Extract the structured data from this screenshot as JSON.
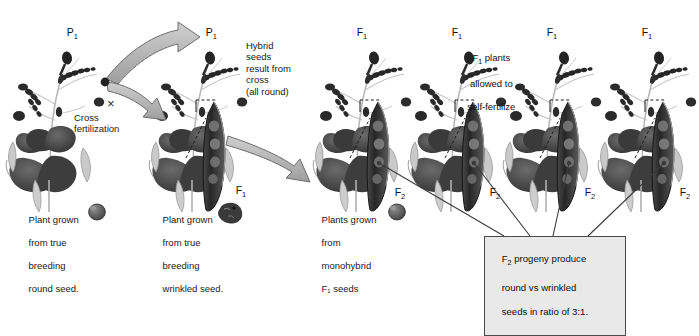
{
  "figure": {
    "type": "genetics-cross-diagram",
    "background": "#ffffff",
    "ink": "#1a1a1a",
    "callout_fill": "#e9e9e9",
    "arrow_fill": "#b6b6b6",
    "arrow_stroke": "#6e6e6e"
  },
  "generation_labels": [
    {
      "id": "p1-left",
      "text": "P",
      "sub": "1",
      "x": 55,
      "y": 14
    },
    {
      "id": "p1-right",
      "text": "P",
      "sub": "1",
      "x": 194,
      "y": 14
    },
    {
      "id": "f1-plant-1",
      "text": "F",
      "sub": "1",
      "x": 345,
      "y": 14
    },
    {
      "id": "f1-plant-2",
      "text": "F",
      "sub": "1",
      "x": 440,
      "y": 14
    },
    {
      "id": "f1-plant-3",
      "text": "F",
      "sub": "1",
      "x": 535,
      "y": 14
    },
    {
      "id": "f1-plant-4",
      "text": "F",
      "sub": "1",
      "x": 630,
      "y": 14
    },
    {
      "id": "f1-pod",
      "text": "F",
      "sub": "1",
      "x": 224,
      "y": 172
    },
    {
      "id": "f2-pod-1",
      "text": "F",
      "sub": "2",
      "x": 383,
      "y": 174
    },
    {
      "id": "f2-pod-2",
      "text": "F",
      "sub": "2",
      "x": 478,
      "y": 174
    },
    {
      "id": "f2-pod-3",
      "text": "F",
      "sub": "2",
      "x": 573,
      "y": 174
    },
    {
      "id": "f2-pod-4",
      "text": "F",
      "sub": "2",
      "x": 668,
      "y": 174
    }
  ],
  "annotations": {
    "cross_symbol": "×",
    "cross_fertilization": "Cross\nfertilization",
    "hybrid_seeds": "Hybrid\nseeds\nresult from\ncross\n(all round)",
    "self_fertilize_line1": "F",
    "self_fertilize_sub": "1",
    "self_fertilize_rest": " plants",
    "self_fertilize_line2": "allowed to",
    "self_fertilize_line3": "self-fertilize"
  },
  "captions": [
    {
      "id": "caption-round-parent",
      "lines": [
        "Plant grown",
        "from true",
        "breeding",
        "round seed."
      ],
      "x": 18,
      "y": 203,
      "seed": {
        "kind": "round-seed-icon",
        "x": 92,
        "y": 203
      }
    },
    {
      "id": "caption-wrinkled-parent",
      "lines": [
        "Plant grown",
        "from true",
        "breeding",
        "wrinkled seed."
      ],
      "x": 152,
      "y": 203,
      "seed": {
        "kind": "wrinkled-seed-icon",
        "x": 226,
        "y": 203
      }
    },
    {
      "id": "caption-f1-progeny",
      "lines": [
        "Plants grown",
        "from",
        "monohybrid",
        "F₁ seeds"
      ],
      "x": 311,
      "y": 203,
      "seed": {
        "kind": "round-seed-icon",
        "x": 392,
        "y": 203
      }
    }
  ],
  "callout": {
    "id": "f2-ratio-callout",
    "line1_prefix": "F",
    "line1_sub": "2",
    "line1_rest": " progeny produce",
    "line2": "round vs wrinkled",
    "line3": "seeds in ratio of 3:1.",
    "x": 484,
    "y": 236,
    "w": 140,
    "h": 48
  },
  "plants": [
    {
      "id": "plant-p1-round",
      "x": 5,
      "pod": false
    },
    {
      "id": "plant-p1-wrinkled",
      "x": 148,
      "pod": true
    },
    {
      "id": "plant-f1-a",
      "x": 312,
      "pod": true
    },
    {
      "id": "plant-f1-b",
      "x": 407,
      "pod": true
    },
    {
      "id": "plant-f1-c",
      "x": 502,
      "pod": true
    },
    {
      "id": "plant-f1-d",
      "x": 597,
      "pod": true
    }
  ],
  "connectors": [
    {
      "id": "connector-f2-1",
      "x1": 379,
      "y1": 163,
      "x2": 504,
      "y2": 236
    },
    {
      "id": "connector-f2-2",
      "x1": 474,
      "y1": 163,
      "x2": 530,
      "y2": 236
    },
    {
      "id": "connector-f2-3",
      "x1": 569,
      "y1": 163,
      "x2": 553,
      "y2": 236
    },
    {
      "id": "connector-f2-4",
      "x1": 664,
      "y1": 163,
      "x2": 588,
      "y2": 236
    }
  ]
}
